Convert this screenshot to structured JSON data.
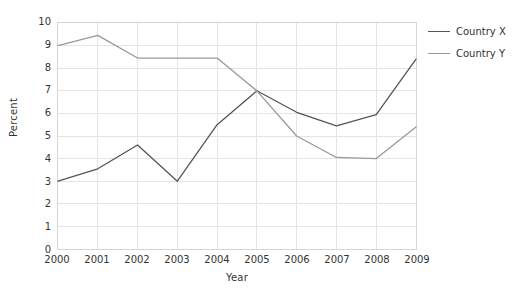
{
  "chart_data": {
    "type": "line",
    "title": "",
    "xlabel": "Year",
    "ylabel": "Percent",
    "categories": [
      "2000",
      "2001",
      "2002",
      "2003",
      "2004",
      "2005",
      "2006",
      "2007",
      "2008",
      "2009"
    ],
    "x": [
      2000,
      2001,
      2002,
      2003,
      2004,
      2005,
      2006,
      2007,
      2008,
      2009
    ],
    "series": [
      {
        "name": "Country X",
        "color": "#555555",
        "values": [
          3.0,
          3.55,
          4.6,
          3.0,
          5.5,
          7.0,
          6.05,
          5.45,
          5.95,
          8.4
        ]
      },
      {
        "name": "Country Y",
        "color": "#999999",
        "values": [
          9.0,
          9.45,
          8.45,
          8.45,
          8.45,
          7.0,
          5.0,
          4.05,
          4.0,
          5.4
        ]
      }
    ],
    "ylim": [
      0,
      10
    ],
    "yticks": [
      "0",
      "1",
      "2",
      "3",
      "4",
      "5",
      "6",
      "7",
      "8",
      "9",
      "10"
    ],
    "ytick_values": [
      0,
      1,
      2,
      3,
      4,
      5,
      6,
      7,
      8,
      9,
      10
    ],
    "xlim": [
      2000,
      2009
    ],
    "grid": true,
    "grid_color": "#e4e4e4",
    "legend_position": "right",
    "background": "#ffffff",
    "axis_color": "#d6d6d6"
  },
  "legend": {
    "entries": [
      {
        "label": "Country X"
      },
      {
        "label": "Country Y"
      }
    ]
  }
}
